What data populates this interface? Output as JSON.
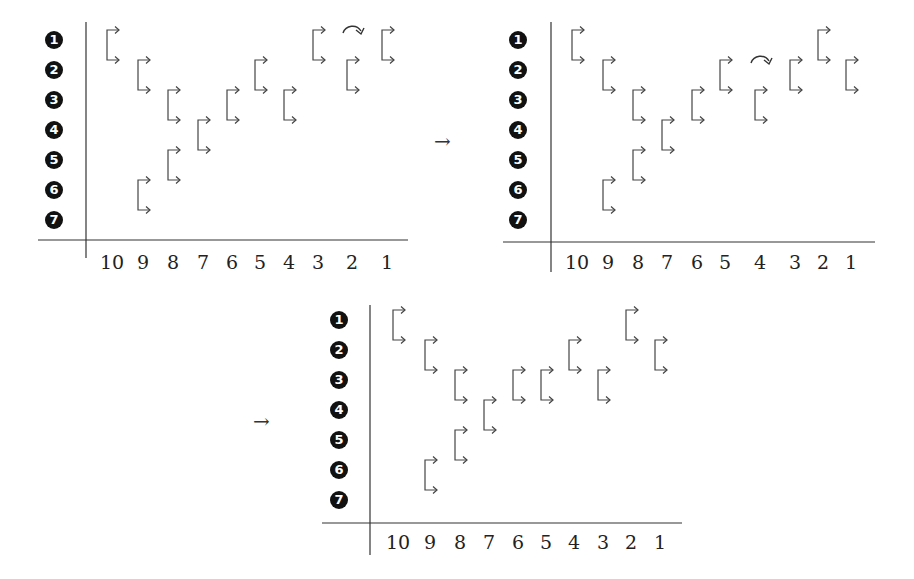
{
  "figure": {
    "transition_arrow": "→",
    "row_labels": [
      "1",
      "2",
      "3",
      "4",
      "5",
      "6",
      "7"
    ],
    "column_labels": [
      "10",
      "9",
      "8",
      "7",
      "6",
      "5",
      "4",
      "3",
      "2",
      "1"
    ],
    "panels": [
      {
        "id": "panel-1",
        "description": "Initial configuration; swap/rotation marked at column 2",
        "axis_x": 86,
        "axis_top": 22,
        "axis_bottom": 258,
        "hline_y": 240,
        "hline_left": 38,
        "hline_right": 408,
        "label_x": 54,
        "label_y": 263,
        "row_y": [
          40,
          70,
          100,
          130,
          160,
          190,
          220
        ],
        "col_x": {
          "10": 112,
          "9": 143,
          "8": 173,
          "7": 203,
          "6": 232,
          "5": 260,
          "4": 289,
          "3": 318,
          "2": 352,
          "1": 387
        },
        "brackets": [
          {
            "col": "10",
            "top": 1,
            "bottom": 2
          },
          {
            "col": "9",
            "top": 2,
            "bottom": 3
          },
          {
            "col": "9",
            "top": 6,
            "bottom": 7
          },
          {
            "col": "8",
            "top": 3,
            "bottom": 4
          },
          {
            "col": "8",
            "top": 5,
            "bottom": 6
          },
          {
            "col": "7",
            "top": 4,
            "bottom": 5
          },
          {
            "col": "6",
            "top": 3,
            "bottom": 4
          },
          {
            "col": "5",
            "top": 2,
            "bottom": 3
          },
          {
            "col": "4",
            "top": 3,
            "bottom": 4
          },
          {
            "col": "3",
            "top": 1,
            "bottom": 2
          },
          {
            "col": "2",
            "top": 2,
            "bottom": 3
          },
          {
            "col": "1",
            "top": 1,
            "bottom": 2
          }
        ],
        "rotation_marker": {
          "col": "2",
          "row": 1
        }
      },
      {
        "id": "panel-2",
        "description": "Intermediate configuration; rotation marked at column 4",
        "axis_x": 551,
        "axis_top": 22,
        "axis_bottom": 272,
        "hline_y": 242,
        "hline_left": 503,
        "hline_right": 875,
        "label_x": 518,
        "label_y": 263,
        "row_y": [
          40,
          70,
          100,
          130,
          160,
          190,
          220
        ],
        "col_x": {
          "10": 577,
          "9": 608,
          "8": 638,
          "7": 667,
          "6": 697,
          "5": 725,
          "4": 760,
          "3": 795,
          "2": 823,
          "1": 851
        },
        "brackets": [
          {
            "col": "10",
            "top": 1,
            "bottom": 2
          },
          {
            "col": "9",
            "top": 2,
            "bottom": 3
          },
          {
            "col": "9",
            "top": 6,
            "bottom": 7
          },
          {
            "col": "8",
            "top": 3,
            "bottom": 4
          },
          {
            "col": "8",
            "top": 5,
            "bottom": 6
          },
          {
            "col": "7",
            "top": 4,
            "bottom": 5
          },
          {
            "col": "6",
            "top": 3,
            "bottom": 4
          },
          {
            "col": "5",
            "top": 2,
            "bottom": 3
          },
          {
            "col": "4",
            "top": 3,
            "bottom": 4
          },
          {
            "col": "3",
            "top": 2,
            "bottom": 3
          },
          {
            "col": "2",
            "top": 1,
            "bottom": 2
          },
          {
            "col": "1",
            "top": 2,
            "bottom": 3
          }
        ],
        "rotation_marker": {
          "col": "4",
          "row": 2
        }
      },
      {
        "id": "panel-3",
        "description": "Final configuration",
        "axis_x": 370,
        "axis_top": 305,
        "axis_bottom": 555,
        "hline_y": 523,
        "hline_left": 322,
        "hline_right": 682,
        "label_x": 339,
        "label_y": 543,
        "row_y": [
          320,
          350,
          380,
          410,
          440,
          470,
          500
        ],
        "col_x": {
          "10": 398,
          "9": 430,
          "8": 460,
          "7": 489,
          "6": 518,
          "5": 546,
          "4": 574,
          "3": 603,
          "2": 631,
          "1": 660
        },
        "brackets": [
          {
            "col": "10",
            "top": 1,
            "bottom": 2
          },
          {
            "col": "9",
            "top": 2,
            "bottom": 3
          },
          {
            "col": "9",
            "top": 6,
            "bottom": 7
          },
          {
            "col": "8",
            "top": 3,
            "bottom": 4
          },
          {
            "col": "8",
            "top": 5,
            "bottom": 6
          },
          {
            "col": "7",
            "top": 4,
            "bottom": 5
          },
          {
            "col": "6",
            "top": 3,
            "bottom": 4
          },
          {
            "col": "5",
            "top": 3,
            "bottom": 4
          },
          {
            "col": "4",
            "top": 2,
            "bottom": 3
          },
          {
            "col": "3",
            "top": 3,
            "bottom": 4
          },
          {
            "col": "2",
            "top": 1,
            "bottom": 2
          },
          {
            "col": "1",
            "top": 2,
            "bottom": 3
          }
        ],
        "rotation_marker": null
      }
    ],
    "transitions": [
      {
        "x": 444,
        "y": 142
      },
      {
        "x": 263,
        "y": 422
      }
    ]
  }
}
